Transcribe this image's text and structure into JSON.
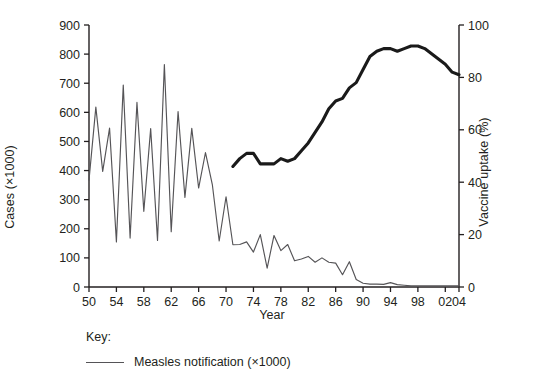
{
  "chart_data": {
    "type": "line",
    "title": "",
    "xlabel": "Year",
    "ylabel": "Cases (×1000)",
    "y2label": "Vaccine uptake (%)",
    "xlim": [
      1950,
      2004
    ],
    "ylim": [
      0,
      900
    ],
    "y2lim": [
      0,
      100
    ],
    "grid": false,
    "x_tick_labels": [
      "50",
      "54",
      "58",
      "62",
      "66",
      "70",
      "74",
      "78",
      "82",
      "86",
      "90",
      "94",
      "98",
      "02",
      "04"
    ],
    "x_tick_values": [
      1950,
      1954,
      1958,
      1962,
      1966,
      1970,
      1974,
      1978,
      1982,
      1986,
      1990,
      1994,
      1998,
      2002,
      2004
    ],
    "y_tick_labels": [
      "0",
      "100",
      "200",
      "300",
      "400",
      "500",
      "600",
      "700",
      "800",
      "900"
    ],
    "y_tick_values": [
      0,
      100,
      200,
      300,
      400,
      500,
      600,
      700,
      800,
      900
    ],
    "y2_tick_labels": [
      "0",
      "20",
      "40",
      "60",
      "80",
      "100"
    ],
    "y2_tick_values": [
      0,
      20,
      40,
      60,
      80,
      100
    ],
    "legend_position": "bottom-left",
    "legend_title": "Key:",
    "series": [
      {
        "name": "Measles notification (×1000)",
        "axis": "left",
        "color": "#555457",
        "line_width": 1.15,
        "x": [
          1950,
          1951,
          1952,
          1953,
          1954,
          1955,
          1956,
          1957,
          1958,
          1959,
          1960,
          1961,
          1962,
          1963,
          1964,
          1965,
          1966,
          1967,
          1968,
          1969,
          1970,
          1971,
          1972,
          1973,
          1974,
          1975,
          1976,
          1977,
          1978,
          1979,
          1980,
          1981,
          1982,
          1983,
          1984,
          1985,
          1986,
          1987,
          1988,
          1989,
          1990,
          1991,
          1992,
          1993,
          1994,
          1995,
          1996,
          1997,
          1998,
          1999,
          2000,
          2001,
          2002,
          2003,
          2004
        ],
        "y": [
          367,
          618,
          397,
          546,
          155,
          694,
          168,
          634,
          260,
          544,
          160,
          764,
          190,
          603,
          308,
          545,
          340,
          462,
          352,
          158,
          310,
          145,
          146,
          155,
          120,
          180,
          65,
          177,
          125,
          146,
          90,
          96,
          105,
          85,
          100,
          85,
          82,
          42,
          87,
          26,
          13,
          10,
          10,
          9,
          15,
          8,
          6,
          4,
          4,
          4,
          4,
          4,
          4,
          4,
          4
        ]
      },
      {
        "name": "Vaccine uptake (%)",
        "axis": "right",
        "color": "#1a1a1a",
        "line_width": 3.1,
        "x": [
          1971,
          1972,
          1973,
          1974,
          1975,
          1976,
          1977,
          1978,
          1979,
          1980,
          1981,
          1982,
          1983,
          1984,
          1985,
          1986,
          1987,
          1988,
          1989,
          1990,
          1991,
          1992,
          1993,
          1994,
          1995,
          1996,
          1997,
          1998,
          1999,
          2000,
          2001,
          2002,
          2003,
          2004
        ],
        "y": [
          46,
          49,
          51,
          51,
          47,
          47,
          47,
          49,
          48,
          49,
          52,
          55,
          59,
          63,
          68,
          71,
          72,
          76,
          78,
          83,
          88,
          90,
          91,
          91,
          90,
          91,
          92,
          92,
          91,
          89,
          87,
          85,
          82,
          81
        ]
      }
    ]
  },
  "legend": {
    "title": "Key:",
    "items": [
      {
        "label": "Measles notification (×1000)",
        "color": "#555457"
      }
    ]
  },
  "axes": {
    "left_title": "Cases (×1000)",
    "right_title": "Vaccine uptake (%)",
    "bottom_title": "Year"
  }
}
